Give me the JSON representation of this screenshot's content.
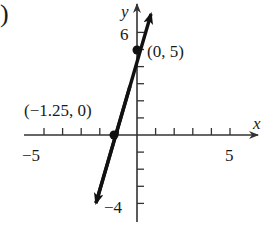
{
  "panel_label": ")",
  "chart_data": {
    "type": "line",
    "title": "",
    "xlabel": "x",
    "ylabel": "y",
    "xlim": [
      -5.5,
      6.5
    ],
    "ylim": [
      -4.5,
      7.5
    ],
    "grid": false,
    "x_tick_labels": [
      {
        "value": -5,
        "label": "−5"
      },
      {
        "value": 5,
        "label": "5"
      }
    ],
    "y_tick_labels": [
      {
        "value": 6,
        "label": "6"
      },
      {
        "value": -4,
        "label": "−4"
      }
    ],
    "x_ticks": [
      -5,
      -4,
      -3,
      -2,
      -1,
      1,
      2,
      3,
      4,
      5
    ],
    "y_ticks": [
      -4,
      -3,
      -2,
      -1,
      1,
      2,
      3,
      4,
      5,
      6
    ],
    "series": [
      {
        "name": "line",
        "equation": "y = 4x + 5",
        "slope": 4,
        "intercept": 5,
        "x_range": [
          -2.2,
          0.75
        ],
        "color": "#111111"
      }
    ],
    "points": [
      {
        "x": 0,
        "y": 5,
        "label": "(0, 5)"
      },
      {
        "x": -1.25,
        "y": 0,
        "label": "(−1.25, 0)"
      }
    ]
  }
}
